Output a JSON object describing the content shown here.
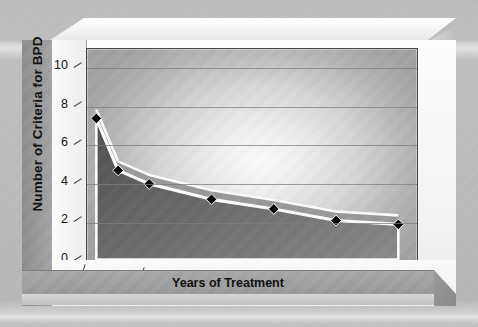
{
  "chart_data": {
    "type": "line",
    "title": "",
    "subtitle": "",
    "xlabel": "Years of Treatment",
    "ylabel": "Number of Criteria for BPD",
    "xlim": [
      0,
      10.6
    ],
    "ylim": [
      0,
      11
    ],
    "xticks": [
      0,
      2,
      4,
      6,
      8,
      10
    ],
    "xtick_labels": [
      "0",
      "2",
      "4",
      "6",
      "8",
      "10"
    ],
    "yticks": [
      0,
      2,
      4,
      6,
      8,
      10
    ],
    "ytick_labels": [
      "0",
      "2",
      "4",
      "6",
      "8",
      "10"
    ],
    "grid": true,
    "grid_axis": "y",
    "legend": false,
    "legend_position": "none",
    "marker": "diamond",
    "marker_color": "#000000",
    "line_color": "#ffffff",
    "area_fill": "#6f6f6f",
    "series": [
      {
        "name": "Number of Criteria for BPD",
        "x": [
          0.3,
          1.0,
          2.0,
          4.0,
          6.0,
          8.0,
          10.0
        ],
        "values": [
          7.4,
          4.7,
          4.0,
          3.2,
          2.7,
          2.1,
          1.9
        ]
      }
    ],
    "annotations": []
  },
  "axis": {
    "y_title": "Number of Criteria for BPD",
    "x_title": "Years of Treatment"
  },
  "colors": {
    "page_background": "#bdbdbd",
    "frame_light": "#f3f3f3",
    "frame_mid": "#a9a9a9",
    "frame_dark": "#8e8e8e",
    "plot_highlight": "#ffffff",
    "plot_shadow": "#a3a3a3",
    "gridline": "#7d7d7d",
    "text": "#111111",
    "line": "#ffffff",
    "marker": "#000000",
    "area": "#6f6f6f"
  }
}
